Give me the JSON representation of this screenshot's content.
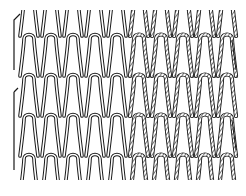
{
  "figure": {
    "columns": 10,
    "rows": 4,
    "x_start": 18,
    "y_start": 14,
    "col_width": 22,
    "row_height": 40,
    "plain_columns": 5,
    "hatched_columns": 5,
    "stroke_color": "#1a1a1a",
    "background": "#ffffff"
  }
}
